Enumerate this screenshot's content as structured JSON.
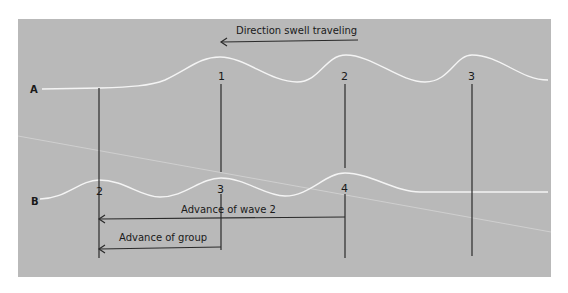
{
  "diagram": {
    "title": "Direction swell traveling",
    "colors": {
      "background": "#ffffff",
      "panel": "#b9b9b9",
      "wave": "#f4f4f4",
      "line": "#2a2a2a",
      "faint_line": "#d0d0d0"
    },
    "rows": [
      {
        "id": "A",
        "label": "A"
      },
      {
        "id": "B",
        "label": "B"
      }
    ],
    "row_A_wave_numbers": [
      "1",
      "2",
      "3"
    ],
    "row_B_wave_numbers": [
      "2",
      "3",
      "4"
    ],
    "annotations": {
      "advance_wave": "Advance of wave 2",
      "advance_group": "Advance of group"
    }
  }
}
